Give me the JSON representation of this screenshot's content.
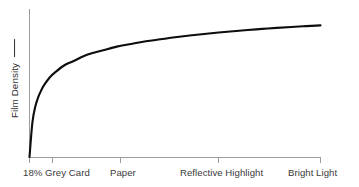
{
  "chart_data": {
    "type": "line",
    "title": "",
    "subtitle": "",
    "xlabel": "",
    "ylabel": "Film Density",
    "ylabel_suffix": "—",
    "grid": false,
    "legend": false,
    "legend_position": "none",
    "xlim": [
      0,
      100
    ],
    "ylim": [
      0,
      100
    ],
    "axis_color": "#9c9c9c",
    "curve_color": "#0d0d0d",
    "text_color": "#3a3a3a",
    "x_tick_labels": [
      "18% Grey Card",
      "Paper",
      "Reflective Highlight",
      "Bright Light"
    ],
    "x_tick_positions": [
      0,
      31.3,
      65.0,
      100
    ],
    "y_tick_labels": [],
    "series": [
      {
        "name": "Film characteristic curve",
        "x": [
          0,
          1,
          2,
          3,
          4,
          5,
          7,
          9,
          12,
          15,
          20,
          25,
          30,
          35,
          40,
          45,
          50,
          55,
          60,
          65,
          70,
          75,
          80,
          85,
          90,
          95,
          100
        ],
        "y": [
          0,
          26,
          38,
          45,
          50,
          54,
          60,
          64,
          69,
          72,
          77,
          80,
          83,
          85,
          87,
          88.5,
          90,
          91.3,
          92.5,
          93.6,
          94.6,
          95.5,
          96.3,
          97.1,
          97.8,
          98.4,
          99
        ]
      }
    ],
    "annotations": []
  },
  "axis": {
    "y_label_text": "Film Density"
  },
  "ticks": [
    {
      "label": "18% Grey Card"
    },
    {
      "label": "Paper"
    },
    {
      "label": "Reflective Highlight"
    },
    {
      "label": "Bright Light"
    }
  ]
}
